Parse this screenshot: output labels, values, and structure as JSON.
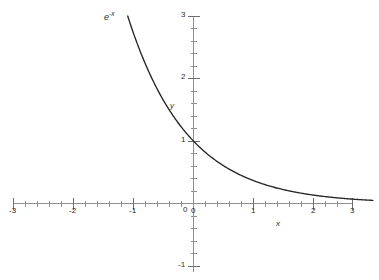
{
  "figure": {
    "background_color": "#ffffff",
    "axis_color": "#8f8f93",
    "curve_color": "#262626",
    "text_color": "#2b2b2b"
  },
  "labels": {
    "curve_base": "e",
    "curve_exponent": "-x",
    "x_axis_name": "x",
    "y_axis_name": "y",
    "origin_y_label": "0",
    "origin_x_label": "0"
  },
  "chart_data": {
    "type": "line",
    "title": "",
    "subtitle": "",
    "xlabel": "x",
    "ylabel": "y",
    "annotations": [
      {
        "text": "e^-x",
        "x": -1.15,
        "y": 3.0,
        "role": "curve-label"
      },
      {
        "text": "y",
        "x": -0.25,
        "y": 1.6,
        "role": "axis-name"
      },
      {
        "text": "x",
        "x": 1.45,
        "y": -0.33,
        "role": "axis-name"
      }
    ],
    "grid": false,
    "legend": null,
    "xlim": [
      -3,
      3
    ],
    "ylim": [
      -1,
      3
    ],
    "x_ticks_major": [
      -3,
      -2,
      -1,
      0,
      1,
      2,
      3
    ],
    "x_tick_labels": [
      "-3",
      "-2",
      "-1",
      "0",
      "1",
      "2",
      "3"
    ],
    "y_ticks_major": [
      -1,
      1,
      2,
      3
    ],
    "y_tick_labels": [
      "-1",
      "1",
      "2",
      "3"
    ],
    "minor_tick_step": 0.2,
    "series": [
      {
        "name": "e^-x",
        "expression": "y = exp(-x)",
        "x": [
          -1.1,
          -1.0,
          -0.9,
          -0.8,
          -0.7,
          -0.6,
          -0.5,
          -0.4,
          -0.3,
          -0.2,
          -0.1,
          0.0,
          0.1,
          0.2,
          0.3,
          0.4,
          0.5,
          0.6,
          0.7,
          0.8,
          0.9,
          1.0,
          1.2,
          1.4,
          1.6,
          1.8,
          2.0,
          2.2,
          2.4,
          2.6,
          2.8,
          3.0
        ],
        "y": [
          3.004,
          2.718,
          2.46,
          2.226,
          2.014,
          1.822,
          1.649,
          1.492,
          1.35,
          1.221,
          1.105,
          1.0,
          0.905,
          0.819,
          0.741,
          0.67,
          0.607,
          0.549,
          0.497,
          0.449,
          0.407,
          0.368,
          0.301,
          0.247,
          0.202,
          0.165,
          0.135,
          0.111,
          0.091,
          0.074,
          0.061,
          0.05
        ]
      }
    ]
  }
}
